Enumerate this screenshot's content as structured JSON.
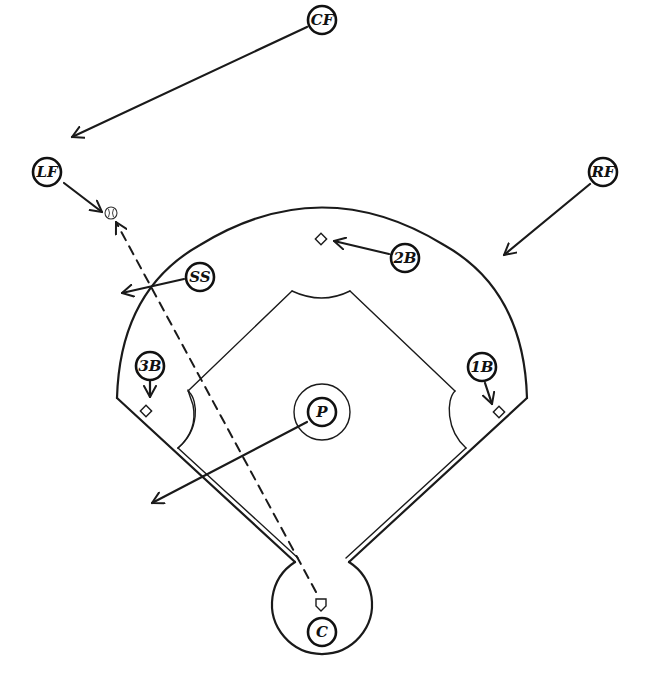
{
  "diagram": {
    "type": "baseball-defensive-positioning",
    "colors": {
      "ink": "#1a1a1a",
      "background": "#ffffff"
    },
    "positions": [
      {
        "id": "cf",
        "label": "CF",
        "name": "center-fielder"
      },
      {
        "id": "lf",
        "label": "LF",
        "name": "left-fielder"
      },
      {
        "id": "rf",
        "label": "RF",
        "name": "right-fielder"
      },
      {
        "id": "ss",
        "label": "SS",
        "name": "shortstop"
      },
      {
        "id": "2b",
        "label": "2B",
        "name": "second-baseman"
      },
      {
        "id": "3b",
        "label": "3B",
        "name": "third-baseman"
      },
      {
        "id": "1b",
        "label": "1B",
        "name": "first-baseman"
      },
      {
        "id": "p",
        "label": "P",
        "name": "pitcher"
      },
      {
        "id": "c",
        "label": "C",
        "name": "catcher"
      }
    ],
    "elements": {
      "ball": "baseball-icon",
      "ball_path": "dashed-line-from-home-plate-to-left-field",
      "bases": [
        "first-base",
        "second-base",
        "third-base",
        "home-plate"
      ]
    }
  }
}
